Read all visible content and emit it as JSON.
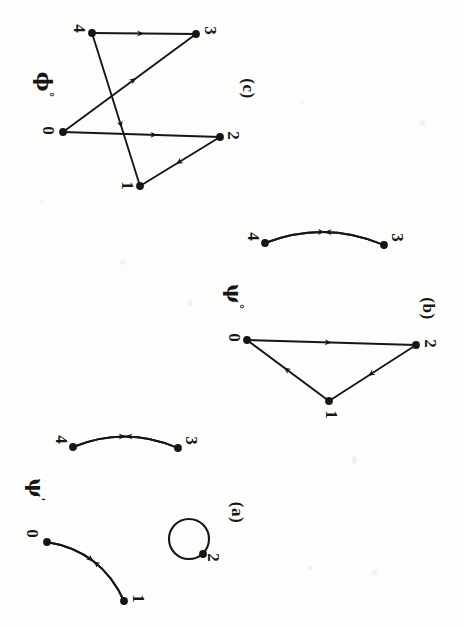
{
  "figure": {
    "background_color": "#fdfdfc",
    "ink_color": "#171614",
    "orientation_note": "page rotated 90 degrees",
    "panels": [
      {
        "id": "a",
        "caption": "(a)",
        "caption_pos": {
          "x": 237,
          "y": 513
        },
        "map_label": "ψ",
        "map_label_sup": "'",
        "map_label_pos": {
          "x": 36,
          "y": 491
        },
        "components": [
          {
            "kind": "double-edge",
            "nodes": [
              {
                "label": "4",
                "x": 73,
                "y": 447,
                "label_x": 61,
                "label_y": 440,
                "filled": true
              },
              {
                "label": "3",
                "x": 178,
                "y": 448,
                "label_x": 191,
                "label_y": 441,
                "filled": true
              }
            ],
            "edges": [
              {
                "from": "4",
                "to": "3",
                "bow": -11,
                "arrow_at": 0.5
              },
              {
                "from": "3",
                "to": "4",
                "bow": 11,
                "arrow_at": 0.5
              }
            ]
          },
          {
            "kind": "double-edge",
            "nodes": [
              {
                "label": "0",
                "x": 47,
                "y": 542,
                "label_x": 32,
                "label_y": 534,
                "filled": true
              },
              {
                "label": "1",
                "x": 124,
                "y": 601,
                "label_x": 138,
                "label_y": 599,
                "filled": true
              }
            ],
            "edges": [
              {
                "from": "0",
                "to": "1",
                "bow": -13,
                "arrow_at": 0.5
              },
              {
                "from": "1",
                "to": "0",
                "bow": 13,
                "arrow_at": 0.5
              }
            ]
          },
          {
            "kind": "self-loop",
            "nodes": [
              {
                "label": "2",
                "x": 203,
                "y": 554,
                "label_x": 213,
                "label_y": 558,
                "filled": true
              }
            ],
            "loop": {
              "cx": 189,
              "cy": 539,
              "r": 20
            }
          }
        ]
      },
      {
        "id": "b",
        "caption": "(b)",
        "caption_pos": {
          "x": 428,
          "y": 309
        },
        "map_label": "ψ",
        "map_label_sup": "°",
        "map_label_pos": {
          "x": 234,
          "y": 298
        },
        "components": [
          {
            "kind": "double-edge",
            "nodes": [
              {
                "label": "4",
                "x": 265,
                "y": 243,
                "label_x": 253,
                "label_y": 237,
                "filled": true
              },
              {
                "label": "3",
                "x": 384,
                "y": 245,
                "label_x": 397,
                "label_y": 238,
                "filled": true
              }
            ],
            "edges": [
              {
                "from": "4",
                "to": "3",
                "bow": -12,
                "arrow_at": 0.5
              },
              {
                "from": "3",
                "to": "4",
                "bow": 12,
                "arrow_at": 0.5
              }
            ]
          },
          {
            "kind": "triangle",
            "nodes": [
              {
                "label": "0",
                "x": 247,
                "y": 340,
                "label_x": 234,
                "label_y": 338,
                "filled": true
              },
              {
                "label": "2",
                "x": 416,
                "y": 345,
                "label_x": 430,
                "label_y": 344,
                "filled": true
              },
              {
                "label": "1",
                "x": 329,
                "y": 401,
                "label_x": 331,
                "label_y": 415,
                "filled": true
              }
            ],
            "edges": [
              {
                "from": "0",
                "to": "2",
                "bow": 0,
                "arrow_at": 0.5
              },
              {
                "from": "2",
                "to": "1",
                "bow": 0,
                "arrow_at": 0.55
              },
              {
                "from": "1",
                "to": "0",
                "bow": 0,
                "arrow_at": 0.55
              }
            ]
          }
        ]
      },
      {
        "id": "c",
        "caption": "(c)",
        "caption_pos": {
          "x": 248,
          "y": 89
        },
        "map_label": "ϕ",
        "map_label_sup": "°",
        "map_label_pos": {
          "x": 44,
          "y": 86
        },
        "components": [
          {
            "kind": "crossed-graph",
            "nodes": [
              {
                "label": "4",
                "x": 92,
                "y": 33,
                "label_x": 79,
                "label_y": 29,
                "filled": true
              },
              {
                "label": "3",
                "x": 196,
                "y": 34,
                "label_x": 210,
                "label_y": 31,
                "filled": true
              },
              {
                "label": "0",
                "x": 63,
                "y": 132,
                "label_x": 48,
                "label_y": 131,
                "filled": true
              },
              {
                "label": "2",
                "x": 220,
                "y": 137,
                "label_x": 233,
                "label_y": 136,
                "filled": true
              },
              {
                "label": "1",
                "x": 140,
                "y": 186,
                "label_x": 127,
                "label_y": 186,
                "filled": true
              }
            ],
            "edges": [
              {
                "from": "4",
                "to": "3",
                "bow": 0,
                "arrow_at": 0.5
              },
              {
                "from": "4",
                "to": "1",
                "bow": 0,
                "arrow_at": 0.62
              },
              {
                "from": "0",
                "to": "3",
                "bow": 0,
                "arrow_at": 0.55
              },
              {
                "from": "0",
                "to": "2",
                "bow": 0,
                "arrow_at": 0.6
              },
              {
                "from": "2",
                "to": "1",
                "bow": 0,
                "arrow_at": 0.55
              }
            ]
          }
        ]
      }
    ]
  }
}
